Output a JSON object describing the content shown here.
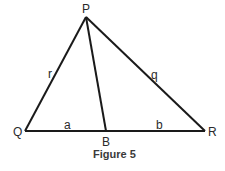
{
  "figure": {
    "caption": "Figure 5",
    "vertices": {
      "P": {
        "label": "P",
        "x": 86,
        "y": 17
      },
      "Q": {
        "label": "Q",
        "x": 25,
        "y": 131
      },
      "R": {
        "label": "R",
        "x": 205,
        "y": 131
      },
      "B": {
        "label": "B",
        "x": 106,
        "y": 131
      }
    },
    "sides": {
      "PQ": {
        "label": "r"
      },
      "PR": {
        "label": "q"
      },
      "QB": {
        "label": "a"
      },
      "BR": {
        "label": "b"
      }
    },
    "segments": [
      "PQ",
      "PR",
      "QR",
      "PB"
    ],
    "stroke_color": "#1a1a1a"
  }
}
